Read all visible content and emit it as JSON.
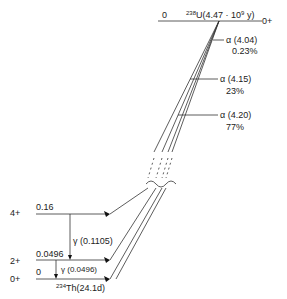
{
  "parent": {
    "level_energy": "0",
    "nuclide_mass": "238",
    "nuclide_label": "U(4.47 · 10",
    "halflife_exp": "9",
    "halflife_unit": " y)",
    "spin": "0+"
  },
  "alpha_branches": [
    {
      "label": "α (4.04)",
      "intensity": "0.23%"
    },
    {
      "label": "α (4.15)",
      "intensity": "23%"
    },
    {
      "label": "α (4.20)",
      "intensity": "77%"
    }
  ],
  "daughter_levels": [
    {
      "spin": "4+",
      "energy": "0.16"
    },
    {
      "spin": "2+",
      "energy": "0.0496"
    },
    {
      "spin": "0+",
      "energy": "0"
    }
  ],
  "gammas": [
    {
      "label": "γ (0.1105)"
    },
    {
      "label": "γ (0.0496)"
    }
  ],
  "daughter": {
    "nuclide_mass": "234",
    "nuclide_label": "Th(24.1d)"
  }
}
